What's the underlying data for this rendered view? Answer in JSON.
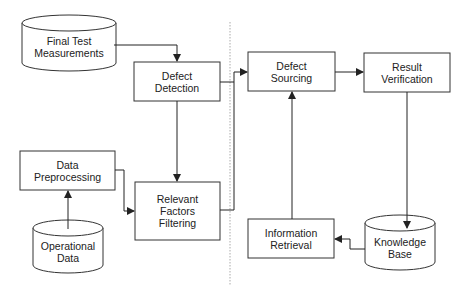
{
  "diagram": {
    "type": "flowchart",
    "colors": {
      "line": "#222222",
      "divider": "#aaaaaa",
      "background": "#ffffff"
    },
    "nodes": {
      "final_test": {
        "shape": "cylinder",
        "line1": "Final Test",
        "line2": "Measurements"
      },
      "defect_detection": {
        "shape": "box",
        "line1": "Defect",
        "line2": "Detection"
      },
      "data_preprocessing": {
        "shape": "box",
        "line1": "Data",
        "line2": "Preprocessing"
      },
      "operational_data": {
        "shape": "cylinder",
        "line1": "Operational",
        "line2": "Data"
      },
      "relevant_factors": {
        "shape": "box",
        "line1": "Relevant",
        "line2": "Factors",
        "line3": "Filtering"
      },
      "defect_sourcing": {
        "shape": "box",
        "line1": "Defect",
        "line2": "Sourcing"
      },
      "result_verification": {
        "shape": "box",
        "line1": "Result",
        "line2": "Verification"
      },
      "information_retrieval": {
        "shape": "box",
        "line1": "Information",
        "line2": "Retrieval"
      },
      "knowledge_base": {
        "shape": "cylinder",
        "line1": "Knowledge",
        "line2": "Base"
      }
    },
    "edges": [
      [
        "Final Test Measurements",
        "Defect Detection"
      ],
      [
        "Defect Detection",
        "Relevant Factors Filtering"
      ],
      [
        "Operational Data",
        "Data Preprocessing"
      ],
      [
        "Data Preprocessing",
        "Relevant Factors Filtering"
      ],
      [
        "Defect Detection",
        "Defect Sourcing"
      ],
      [
        "Relevant Factors Filtering",
        "Defect Sourcing"
      ],
      [
        "Defect Sourcing",
        "Result Verification"
      ],
      [
        "Result Verification",
        "Knowledge Base"
      ],
      [
        "Knowledge Base",
        "Information Retrieval"
      ],
      [
        "Information Retrieval",
        "Defect Sourcing"
      ]
    ]
  }
}
